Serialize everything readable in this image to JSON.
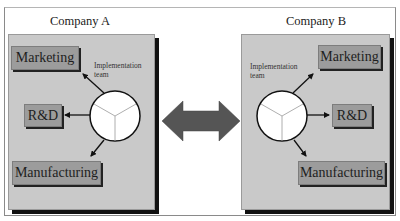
{
  "diagram": {
    "companies": [
      {
        "title": "Company A",
        "team_label_line1": "Implementation",
        "team_label_line2": "team",
        "departments": [
          "Marketing",
          "R&D",
          "Manufacturing"
        ]
      },
      {
        "title": "Company B",
        "team_label_line1": "Implementation",
        "team_label_line2": "team",
        "departments": [
          "Marketing",
          "R&D",
          "Manufacturing"
        ]
      }
    ],
    "connector": "bidirectional-arrow",
    "colors": {
      "panel": "#c9c9c9",
      "department_box": "#9c9c9c",
      "arrow": "#555555",
      "shadow": "#111111",
      "circle": "#ffffff"
    }
  }
}
